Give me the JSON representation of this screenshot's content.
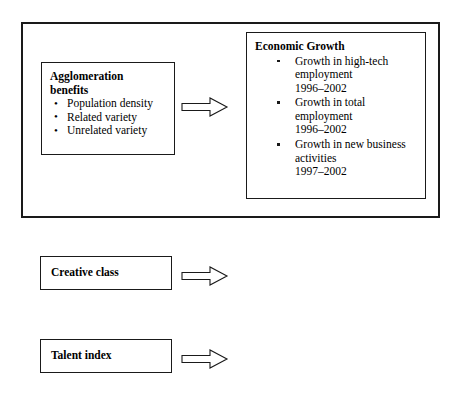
{
  "diagram": {
    "outer_frame": {
      "name": "regional-factors-container"
    },
    "boxes": {
      "agglomeration": {
        "title": "Agglomeration benefits",
        "title_line1": "Agglomeration",
        "title_line2": "benefits",
        "bullet_style": "round",
        "items": [
          "Population density",
          "Related variety",
          "Unrelated variety"
        ]
      },
      "economic_growth": {
        "title": "Economic Growth",
        "bullet_style": "square",
        "items": [
          {
            "line1": "Growth in high-tech",
            "line2": "employment",
            "line3": "1996–2002"
          },
          {
            "line1": "Growth in total",
            "line2": "employment",
            "line3": "1996–2002"
          },
          {
            "line1": "Growth in new business",
            "line2": "activities",
            "line3": "1997–2002"
          }
        ]
      },
      "creative_class": {
        "title": "Creative class"
      },
      "talent_index": {
        "title": "Talent index"
      }
    },
    "arrows": [
      {
        "id": "arrow-agglomeration-to-growth",
        "direction": "right"
      },
      {
        "id": "arrow-creative-class-to-growth",
        "direction": "right"
      },
      {
        "id": "arrow-talent-index-to-growth",
        "direction": "right"
      }
    ],
    "colors": {
      "line": "#1a1a1a",
      "background": "#ffffff",
      "text": "#000000"
    }
  }
}
